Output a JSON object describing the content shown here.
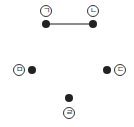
{
  "diagram": {
    "nodes": [
      {
        "id": "giyeok",
        "label": "ㄱ",
        "dot": [
          46,
          24
        ],
        "labelPos": [
          46,
          11
        ]
      },
      {
        "id": "nieun",
        "label": "ㄴ",
        "dot": [
          93,
          24
        ],
        "labelPos": [
          93,
          11
        ]
      },
      {
        "id": "digeut",
        "label": "ㄷ",
        "dot": [
          107,
          70
        ],
        "labelPos": [
          120,
          70
        ]
      },
      {
        "id": "rieul",
        "label": "ㄹ",
        "dot": [
          69,
          98
        ],
        "labelPos": [
          69,
          113
        ]
      },
      {
        "id": "mieum",
        "label": "ㅁ",
        "dot": [
          32,
          70
        ],
        "labelPos": [
          19,
          70
        ]
      }
    ],
    "edges": [
      {
        "from": "giyeok",
        "to": "nieun",
        "color": "#666666"
      }
    ]
  }
}
